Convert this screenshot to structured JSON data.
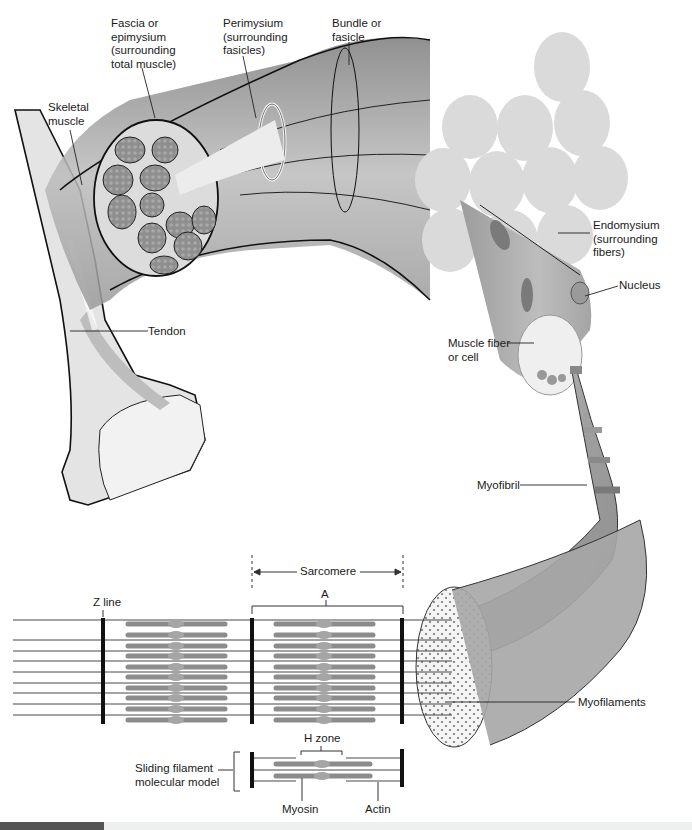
{
  "figure": {
    "labels": {
      "fascia": "Fascia or\nepimysium\n(surrounding\ntotal muscle)",
      "perimysium": "Perimysium\n(surrounding\nfasicles)",
      "bundle": "Bundle or\nfasicle",
      "skeletal_muscle": "Skeletal\nmuscle",
      "endomysium": "Endomysium\n(surrounding\nfibers)",
      "nucleus": "Nucleus",
      "tendon": "Tendon",
      "muscle_fiber": "Muscle fiber\nor cell",
      "myofibril": "Myofibril",
      "sarcomere": "Sarcomere",
      "a_band": "A",
      "z_line": "Z line",
      "myofilaments": "Myofilaments",
      "h_zone": "H zone",
      "sliding_model": "Sliding filament\nmolecular model",
      "myosin": "Myosin",
      "actin": "Actin"
    },
    "colors": {
      "outline": "#111111",
      "muscle_light": "#d9d9d9",
      "muscle_mid": "#b0b0b0",
      "muscle_dark": "#8a8a8a",
      "bone": "#e6e6e6",
      "filament": "#8c8c8c",
      "footer_accent": "#555555"
    }
  }
}
